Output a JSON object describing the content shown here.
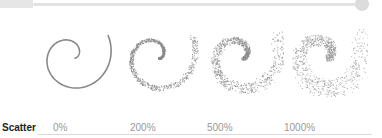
{
  "slider": {
    "label": "scatter-amount-slider",
    "fill_color": "#e6e6e6",
    "track_color": "#e3e3e3",
    "knob_color": "#dcdcdc"
  },
  "spirals": [
    {
      "scatter": "0%",
      "stroke": "#888888"
    },
    {
      "scatter": "200%",
      "stroke": "#888888"
    },
    {
      "scatter": "500%",
      "stroke": "#8a8a8a"
    },
    {
      "scatter": "1000%",
      "stroke": "#999999"
    }
  ],
  "labels": {
    "title": "Scatter",
    "values": [
      "0%",
      "200%",
      "500%",
      "1000%"
    ]
  }
}
